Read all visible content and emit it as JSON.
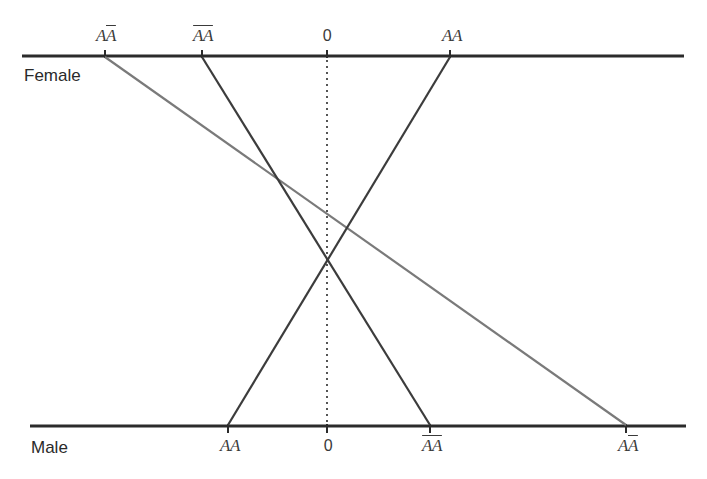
{
  "diagram": {
    "type": "norm-of-reaction / genotype line diagram",
    "top_axis": {
      "name": "Female",
      "y": 56,
      "x_start": 22,
      "x_end": 684,
      "ticks": [
        {
          "label_main": "A",
          "label_bar": "A",
          "order": "plain-then-bar",
          "text": "AĀ",
          "x": 105
        },
        {
          "label_main": "",
          "label_bar": "AA",
          "order": "bar-both",
          "text": "ĀĀ",
          "x": 202
        },
        {
          "label_main": "0",
          "label_bar": "",
          "order": "zero",
          "text": "0",
          "x": 327
        },
        {
          "label_main": "AA",
          "label_bar": "",
          "order": "plain",
          "text": "AA",
          "x": 450
        }
      ]
    },
    "bottom_axis": {
      "name": "Male",
      "y": 426,
      "x_start": 30,
      "x_end": 686,
      "ticks": [
        {
          "text": "AA",
          "x": 228
        },
        {
          "text": "0",
          "x": 327
        },
        {
          "text": "ĀĀ",
          "x": 430
        },
        {
          "text": "AĀ",
          "x": 626
        }
      ]
    },
    "connections": [
      {
        "genotype": "AĀ",
        "from_x": 105,
        "to_x": 626,
        "color": "#7a7a7a"
      },
      {
        "genotype": "ĀĀ",
        "from_x": 202,
        "to_x": 430,
        "color": "#3c3c3c"
      },
      {
        "genotype": "AA",
        "from_x": 450,
        "to_x": 228,
        "color": "#3c3c3c"
      }
    ],
    "zero_line": {
      "x": 327,
      "style": "dotted",
      "color": "#555555"
    },
    "colors": {
      "axis": "#2b2b2b",
      "text": "#333333",
      "background": "#ffffff"
    }
  },
  "labels": {
    "female": "Female",
    "male": "Male",
    "top": {
      "t0": {
        "plain": "A",
        "barred": "A"
      },
      "t1": {
        "barred1": "A",
        "barred2": "A"
      },
      "t2": "0",
      "t3": "AA"
    },
    "bottom": {
      "b0": "AA",
      "b1": "0",
      "b2": {
        "barred1": "A",
        "barred2": "A"
      },
      "b3": {
        "plain": "A",
        "barred": "A"
      }
    }
  }
}
